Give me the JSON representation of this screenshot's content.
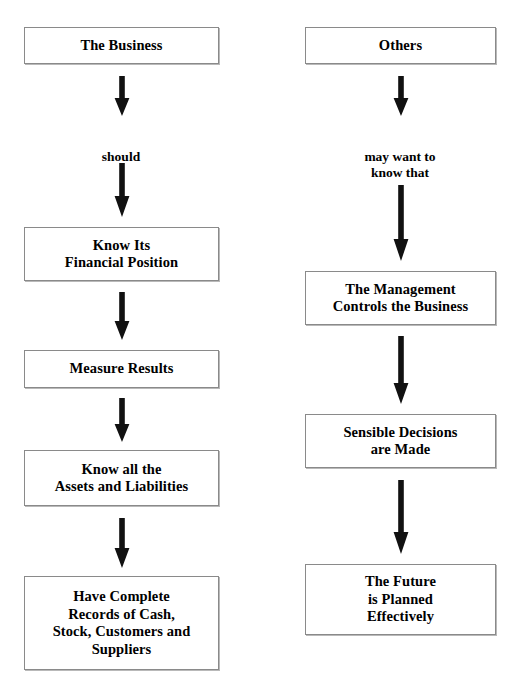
{
  "page": {
    "width": 515,
    "height": 687,
    "background": "#ffffff",
    "box_border_color": "#8a8a8a",
    "box_shadow_color": "#b9b9b9",
    "arrow_color": "#111111",
    "text_color": "#000000",
    "faint_top_artifact": "     "
  },
  "diagram": {
    "type": "flowchart",
    "orientation": "top-to-bottom",
    "columns": [
      {
        "id": "left",
        "name": "business-column",
        "center_x": 121,
        "box_left": 24,
        "box_right": 219,
        "nodes": [
          {
            "id": "the-business",
            "label": "The Business",
            "x": 24,
            "y": 27,
            "w": 195,
            "h": 37
          },
          {
            "id": "know-its-financial-position",
            "label": "Know Its\nFinancial Position",
            "x": 24,
            "y": 227,
            "w": 195,
            "h": 54
          },
          {
            "id": "measure-results",
            "label": "Measure Results",
            "x": 24,
            "y": 350,
            "w": 195,
            "h": 38
          },
          {
            "id": "know-all-assets-liabilities",
            "label": "Know all the\nAssets and Liabilities",
            "x": 24,
            "y": 450,
            "w": 195,
            "h": 56
          },
          {
            "id": "have-complete-records",
            "label": "Have Complete\nRecords of Cash,\nStock, Customers and\nSuppliers",
            "x": 24,
            "y": 576,
            "w": 195,
            "h": 94
          }
        ],
        "edge_labels": [
          {
            "id": "should",
            "text": "should",
            "x": 71,
            "y": 133,
            "w": 100
          }
        ],
        "arrows": [
          {
            "id": "business-to-should",
            "x": 114,
            "y": 76,
            "w": 16,
            "h": 40
          },
          {
            "id": "should-to-financial-position",
            "x": 114,
            "y": 163,
            "w": 16,
            "h": 54
          },
          {
            "id": "financial-position-to-measure-results",
            "x": 114,
            "y": 292,
            "w": 16,
            "h": 48
          },
          {
            "id": "measure-results-to-assets-liabilities",
            "x": 114,
            "y": 398,
            "w": 16,
            "h": 44
          },
          {
            "id": "assets-liabilities-to-records",
            "x": 114,
            "y": 518,
            "w": 16,
            "h": 50
          }
        ]
      },
      {
        "id": "right",
        "name": "others-column",
        "center_x": 400,
        "box_left": 305,
        "box_right": 496,
        "nodes": [
          {
            "id": "others",
            "label": "Others",
            "x": 305,
            "y": 27,
            "w": 191,
            "h": 37
          },
          {
            "id": "management-controls-business",
            "label": "The Management\nControls the Business",
            "x": 305,
            "y": 271,
            "w": 191,
            "h": 54
          },
          {
            "id": "sensible-decisions-are-made",
            "label": "Sensible Decisions\nare Made",
            "x": 305,
            "y": 414,
            "w": 191,
            "h": 54
          },
          {
            "id": "future-is-planned-effectively",
            "label": "The Future\nis Planned\nEffectively",
            "x": 305,
            "y": 564,
            "w": 191,
            "h": 71
          }
        ],
        "edge_labels": [
          {
            "id": "may-want-to-know-that",
            "text": "may want to\nknow that",
            "x": 350,
            "y": 133,
            "w": 100
          }
        ],
        "arrows": [
          {
            "id": "others-to-may-want",
            "x": 393,
            "y": 76,
            "w": 16,
            "h": 40
          },
          {
            "id": "may-want-to-management",
            "x": 393,
            "y": 185,
            "w": 16,
            "h": 76
          },
          {
            "id": "management-to-decisions",
            "x": 393,
            "y": 336,
            "w": 16,
            "h": 68
          },
          {
            "id": "decisions-to-future",
            "x": 393,
            "y": 480,
            "w": 16,
            "h": 74
          }
        ]
      }
    ]
  }
}
